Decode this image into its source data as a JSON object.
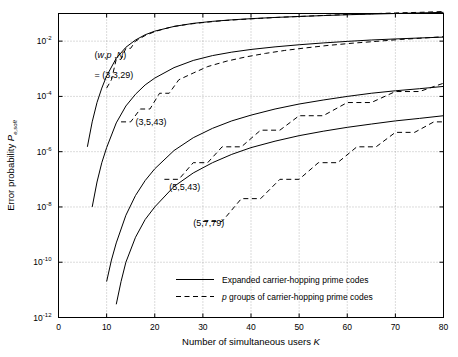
{
  "chart_data": {
    "type": "line",
    "title": "",
    "xlabel": "Number of simultaneous users",
    "xlabel_sym": "K",
    "ylabel": "Error probability",
    "ylabel_sym": "P",
    "ylabel_sub": "e,soft",
    "xlim": [
      0,
      80
    ],
    "ylim": [
      1e-12,
      0.1
    ],
    "yscale": "log",
    "grid": true,
    "xticks": [
      0,
      10,
      20,
      30,
      40,
      50,
      60,
      70,
      80
    ],
    "xticklabels": [
      "0",
      "10",
      "20",
      "30",
      "40",
      "50",
      "60",
      "70",
      "80"
    ],
    "yticks": [
      -2,
      -4,
      -6,
      -8,
      -10,
      -12
    ],
    "yticklabels": [
      "10",
      "10",
      "10",
      "10",
      "10",
      "10"
    ],
    "yticksup": [
      "-2",
      "-4",
      "-6",
      "-8",
      "-10",
      "-12"
    ],
    "legend": {
      "position": "lower-center",
      "entries": [
        {
          "label": "Expanded carrier-hopping prime codes",
          "style": "solid"
        },
        {
          "label_pre": "p",
          "label": "groups of carrier-hopping prime codes",
          "style": "dashed"
        }
      ]
    },
    "annotations": [
      {
        "text": "(w,p ,N)",
        "x": 7.5,
        "y": 0.0025,
        "italic_parts": "w,p,N"
      },
      {
        "text": "= (3,3,29)",
        "x": 7.5,
        "y": 0.00045
      },
      {
        "text": "(3,5,43)",
        "x": 16.0,
        "y": 9e-06
      },
      {
        "text": "(5,5,43)",
        "x": 23.0,
        "y": 4e-08
      },
      {
        "text": "(5,7,79)",
        "x": 28.0,
        "y": 2e-09
      }
    ],
    "series": [
      {
        "name": "(3,3,29) expanded",
        "style": "solid",
        "x": [
          6,
          7,
          8,
          9,
          10,
          12,
          14,
          16,
          18,
          20,
          24,
          28,
          32,
          36,
          40,
          45,
          50,
          55,
          60,
          65,
          70,
          75,
          80
        ],
        "y": [
          1.5e-06,
          1.2e-05,
          6e-05,
          0.0002,
          0.00055,
          0.0024,
          0.006,
          0.011,
          0.017,
          0.023,
          0.034,
          0.044,
          0.052,
          0.059,
          0.065,
          0.072,
          0.078,
          0.084,
          0.09,
          0.095,
          0.1,
          0.105,
          0.11
        ]
      },
      {
        "name": "(3,3,29) p groups",
        "style": "dashed",
        "x": [
          10,
          11,
          12,
          13,
          14,
          15,
          16,
          18,
          20,
          22,
          24,
          27,
          30,
          34,
          38,
          42,
          46,
          50,
          55,
          60,
          65,
          70,
          75,
          80
        ],
        "y": [
          0.0002,
          0.0004,
          0.0022,
          0.0022,
          0.0055,
          0.0055,
          0.01,
          0.016,
          0.022,
          0.028,
          0.034,
          0.041,
          0.047,
          0.055,
          0.061,
          0.067,
          0.073,
          0.078,
          0.085,
          0.092,
          0.098,
          0.105,
          0.11,
          0.118
        ]
      },
      {
        "name": "(3,5,43) expanded",
        "style": "solid",
        "x": [
          7,
          8,
          9,
          10,
          12,
          14,
          16,
          18,
          20,
          24,
          28,
          32,
          36,
          40,
          45,
          50,
          55,
          60,
          65,
          70,
          75,
          80
        ],
        "y": [
          1e-08,
          8e-08,
          4e-07,
          1.4e-06,
          1.1e-05,
          4.5e-05,
          0.00012,
          0.00026,
          0.00046,
          0.0011,
          0.002,
          0.003,
          0.004,
          0.005,
          0.0062,
          0.0074,
          0.0086,
          0.0098,
          0.011,
          0.012,
          0.013,
          0.014
        ]
      },
      {
        "name": "(3,5,43) p groups",
        "style": "dashed",
        "x": [
          13,
          15,
          17,
          19,
          21,
          23,
          25,
          28,
          31,
          35,
          39,
          43,
          47,
          51,
          56,
          61,
          66,
          71,
          76,
          80
        ],
        "y": [
          1.2e-05,
          1.2e-05,
          3.5e-05,
          3.5e-05,
          0.00013,
          0.00013,
          0.0004,
          0.0007,
          0.0012,
          0.0019,
          0.0027,
          0.0036,
          0.0046,
          0.0056,
          0.007,
          0.0084,
          0.0098,
          0.0115,
          0.013,
          0.0145
        ]
      },
      {
        "name": "(5,5,43) expanded",
        "style": "solid",
        "x": [
          10,
          11,
          12,
          14,
          16,
          18,
          20,
          24,
          28,
          32,
          36,
          40,
          45,
          50,
          55,
          60,
          65,
          70,
          75,
          80
        ],
        "y": [
          2e-11,
          1.2e-10,
          5e-10,
          5e-09,
          2.6e-08,
          9e-08,
          2.4e-07,
          1.1e-06,
          3.2e-06,
          7e-06,
          1.3e-05,
          2.1e-05,
          3.5e-05,
          5.3e-05,
          7.4e-05,
          0.0001,
          0.00013,
          0.00016,
          0.00019,
          0.00023
        ]
      },
      {
        "name": "(5,5,43) p groups",
        "style": "dashed",
        "x": [
          22,
          25,
          28,
          31,
          34,
          38,
          42,
          46,
          50,
          55,
          60,
          65,
          70,
          75,
          80
        ],
        "y": [
          1e-07,
          1e-07,
          4e-07,
          4e-07,
          1.5e-06,
          1.5e-06,
          6e-06,
          6e-06,
          2e-05,
          2e-05,
          6e-05,
          6e-05,
          0.00015,
          0.00015,
          0.0003
        ]
      },
      {
        "name": "(5,7,79) expanded",
        "style": "solid",
        "x": [
          12,
          13,
          14,
          16,
          18,
          20,
          24,
          28,
          32,
          36,
          40,
          45,
          50,
          55,
          60,
          65,
          70,
          75,
          80
        ],
        "y": [
          3e-12,
          2e-11,
          1e-10,
          8e-10,
          3.5e-09,
          1e-08,
          5.5e-08,
          1.7e-07,
          4e-07,
          8e-07,
          1.4e-06,
          2.4e-06,
          3.8e-06,
          5.5e-06,
          7.6e-06,
          1e-05,
          1.3e-05,
          1.6e-05,
          2e-05
        ]
      },
      {
        "name": "(5,7,79) p groups",
        "style": "dashed",
        "x": [
          30,
          34,
          38,
          42,
          46,
          50,
          54,
          58,
          62,
          66,
          70,
          74,
          78,
          80
        ],
        "y": [
          3e-09,
          3e-09,
          2e-08,
          2e-08,
          1e-07,
          1e-07,
          4e-07,
          4e-07,
          1.5e-06,
          1.5e-06,
          5e-06,
          5e-06,
          1.2e-05,
          1.2e-05
        ]
      }
    ]
  }
}
